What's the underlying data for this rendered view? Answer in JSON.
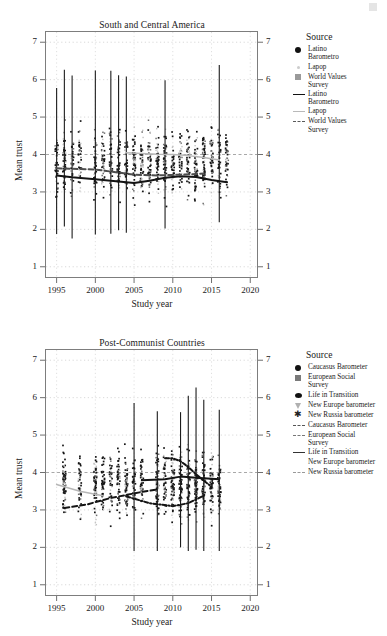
{
  "figure": {
    "corner_mark": "faint-artifact"
  },
  "panels": [
    {
      "id": "south-central-america",
      "title": "South and Central America",
      "xlabel": "Study year",
      "ylabel": "Mean trust",
      "xticks": [
        "1995",
        "2000",
        "2005",
        "2010",
        "2015",
        "2020"
      ],
      "yticks": [
        "1",
        "2",
        "3",
        "4",
        "5",
        "6",
        "7"
      ],
      "legend": {
        "title": "Source",
        "point_entries": [
          {
            "label": "Latino\nBarometro",
            "marker": "filled-circle",
            "color": "#111111"
          },
          {
            "label": "Lapop",
            "marker": "small-light-dot",
            "color": "#cccccc"
          },
          {
            "label": "World Values\nSurvey",
            "marker": "filled-square",
            "color": "#9a9a9a"
          }
        ],
        "line_entries": [
          {
            "label": "Latino\nBarometro",
            "marker": "solid-line",
            "color": "#111111"
          },
          {
            "label": "Lapop",
            "marker": "light-line",
            "color": "#bbbbbb"
          },
          {
            "label": "World Values\nSurvey",
            "marker": "dashed-line",
            "color": "#5a5a5a"
          }
        ]
      }
    },
    {
      "id": "post-communist-countries",
      "title": "Post-Communist Countries",
      "xlabel": "Study year",
      "ylabel": "Mean trust",
      "xticks": [
        "1995",
        "2000",
        "2005",
        "2010",
        "2015",
        "2020"
      ],
      "yticks": [
        "1",
        "2",
        "3",
        "4",
        "5",
        "6",
        "7"
      ],
      "legend": {
        "title": "Source",
        "point_entries": [
          {
            "label": "Caucasus Barometer",
            "marker": "filled-circle",
            "color": "#111111"
          },
          {
            "label": "European Social\nSurvey",
            "marker": "filled-square",
            "color": "#7a7a7a"
          },
          {
            "label": "Life in Transition",
            "marker": "filled-ellipse",
            "color": "#111111"
          },
          {
            "label": "New Europe barometer",
            "marker": "triangle-down",
            "color": "#b0b0b0"
          },
          {
            "label": "New Russia barometer",
            "marker": "asterisk",
            "color": "#222222"
          }
        ],
        "line_entries": [
          {
            "label": "Caucasus Barometer",
            "marker": "dash-dot-line",
            "color": "#555555"
          },
          {
            "label": "European Social\nSurvey",
            "marker": "dashed-line",
            "color": "#777777"
          },
          {
            "label": "Life in Transition",
            "marker": "solid-curve",
            "color": "#333333"
          },
          {
            "label": "New Europe barometer",
            "marker": "blank-line",
            "color": "#ffffff"
          },
          {
            "label": "New Russia barometer",
            "marker": "dash-dot-line",
            "color": "#999999"
          }
        ]
      }
    }
  ],
  "chart_data": [
    {
      "type": "scatter",
      "title": "South and Central America",
      "xlabel": "Study year",
      "ylabel": "Mean trust",
      "xlim": [
        1993.5,
        2021
      ],
      "ylim": [
        0.7,
        7.3
      ],
      "xticks": [
        1995,
        2000,
        2005,
        2010,
        2015,
        2020
      ],
      "yticks": [
        1,
        2,
        3,
        4,
        5,
        6,
        7
      ],
      "grid": true,
      "legend_position": "right",
      "series": [
        {
          "name": "Latino Barometro",
          "marker": "filled-circle",
          "color": "#111111",
          "trend_x": [
            1995,
            1997,
            2000,
            2003,
            2005,
            2007,
            2009,
            2011,
            2013,
            2015,
            2017
          ],
          "trend_y": [
            3.44,
            3.39,
            3.34,
            3.28,
            3.24,
            3.3,
            3.38,
            3.42,
            3.4,
            3.32,
            3.26
          ]
        },
        {
          "name": "Lapop",
          "marker": "small-light-dot",
          "color": "#bbbbbb",
          "trend_x": [
            2004,
            2006,
            2008,
            2010,
            2012,
            2014,
            2016
          ],
          "trend_y": [
            4.05,
            4.03,
            4.01,
            4.0,
            3.97,
            3.92,
            3.85
          ]
        },
        {
          "name": "World Values Survey",
          "marker": "filled-square",
          "color": "#5a5a5a",
          "trend_x": [
            1995,
            2000,
            2005,
            2008,
            2011,
            2014
          ],
          "trend_y": [
            3.63,
            3.6,
            3.46,
            3.44,
            3.46,
            3.49
          ]
        }
      ],
      "point_year_bands": [
        1995,
        1996,
        1997,
        1998,
        2000,
        2001,
        2002,
        2003,
        2004,
        2005,
        2006,
        2007,
        2008,
        2009,
        2010,
        2011,
        2012,
        2013,
        2014,
        2015,
        2016,
        2017
      ],
      "point_value_range": [
        1.4,
        6.4
      ]
    },
    {
      "type": "scatter",
      "title": "Post-Communist Countries",
      "xlabel": "Study year",
      "ylabel": "Mean trust",
      "xlim": [
        1993.5,
        2021
      ],
      "ylim": [
        0.7,
        7.3
      ],
      "xticks": [
        1995,
        2000,
        2005,
        2010,
        2015,
        2020
      ],
      "yticks": [
        1,
        2,
        3,
        4,
        5,
        6,
        7
      ],
      "grid": true,
      "legend_position": "right",
      "series": [
        {
          "name": "Caucasus Barometer",
          "marker": "filled-circle",
          "color": "#333333",
          "trend_x": [
            2009,
            2010,
            2011,
            2012,
            2013,
            2015
          ],
          "trend_y": [
            4.38,
            4.38,
            4.3,
            4.15,
            3.95,
            3.62
          ]
        },
        {
          "name": "European Social Survey",
          "marker": "filled-square",
          "color": "#555555",
          "trend_x": [
            1996,
            1999,
            2002,
            2004,
            2006,
            2008
          ],
          "trend_y": [
            3.05,
            3.15,
            3.32,
            3.4,
            3.48,
            3.55
          ]
        },
        {
          "name": "Life in Transition",
          "marker": "filled-ellipse",
          "color": "#222222",
          "trend_x": [
            2006,
            2009,
            2011,
            2013,
            2016
          ],
          "trend_y": [
            3.79,
            3.82,
            3.89,
            3.86,
            3.82
          ]
        },
        {
          "name": "New Europe barometer",
          "marker": "triangle-down",
          "color": "#b0b0b0",
          "trend_x": [
            1995,
            1998,
            2001
          ],
          "trend_y": [
            3.68,
            3.5,
            3.38
          ]
        },
        {
          "name": "New Russia barometer",
          "marker": "asterisk",
          "color": "#777777",
          "trend_x": [
            2004,
            2007,
            2010,
            2012,
            2014
          ],
          "trend_y": [
            3.36,
            3.18,
            3.1,
            3.18,
            3.38
          ]
        }
      ],
      "point_year_bands": [
        1996,
        1998,
        2000,
        2001,
        2002,
        2003,
        2004,
        2005,
        2006,
        2008,
        2009,
        2010,
        2011,
        2012,
        2013,
        2014,
        2015,
        2016
      ],
      "point_value_range": [
        1.9,
        6.8
      ]
    }
  ]
}
